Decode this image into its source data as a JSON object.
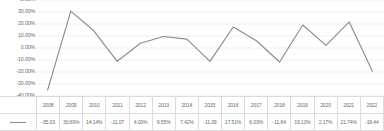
{
  "chart_data": {
    "type": "line",
    "title": "",
    "xlabel": "",
    "ylabel": "",
    "ylim": [
      -40,
      40
    ],
    "y_tick_step": 10,
    "grid": true,
    "legend_position": "bottom-table",
    "series_name": "",
    "line_color": "#8c8c8c",
    "gridline_color": "#e4e4e4",
    "text_color": "#6b6b6b",
    "y_tick_labels": [
      "40.00%",
      "30.00%",
      "20.00%",
      "10.00%",
      "0.00%",
      "-10.00%",
      "-20.00%",
      "-30.00%",
      "-40.00%"
    ],
    "y_tick_values": [
      40,
      30,
      20,
      10,
      0,
      -10,
      -20,
      -30,
      -40
    ],
    "categories": [
      "2008",
      "2009",
      "2010",
      "2011",
      "2012",
      "2013",
      "2014",
      "2015",
      "2016",
      "2017",
      "2018",
      "2019",
      "2020",
      "2021",
      "2022"
    ],
    "values": [
      -35.03,
      30.69,
      14.14,
      -11.07,
      4.0,
      9.55,
      7.42,
      -11.09,
      17.51,
      6.03,
      -11.64,
      19.13,
      2.17,
      21.74,
      -19.44
    ],
    "value_labels": [
      "-35.03",
      "30.69%",
      "14.14%",
      "-11.07",
      "4.00%",
      "9.55%",
      "7.42%",
      "-11.09",
      "17.51%",
      "6.03%",
      "-11.64",
      "19.13%",
      "2.17%",
      "21.74%",
      "-19.44"
    ]
  }
}
